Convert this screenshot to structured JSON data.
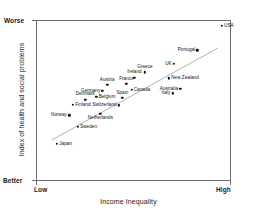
{
  "chart_data": {
    "type": "scatter",
    "title": "",
    "xlabel": "Income Inequality",
    "ylabel": "Index of health and social problems",
    "x_tick_labels": [
      "Low",
      "High"
    ],
    "y_tick_labels": [
      "Worse",
      "Better"
    ],
    "y_axis_top_label": "Worse",
    "y_axis_bottom_label": "Better",
    "x_axis_left_label": "Low",
    "x_axis_right_label": "High",
    "grid": false,
    "legend": null,
    "xlim": [
      0,
      1
    ],
    "ylim": [
      0,
      1
    ],
    "trendline": {
      "type": "linear-fit",
      "x0": 0.082,
      "y0": 0.255,
      "x1": 0.933,
      "y1": 0.826,
      "color": "#a8a8a8"
    },
    "point_color": "#111111",
    "points": [
      {
        "label": "USA",
        "x": 0.953,
        "y": 0.963,
        "label_pos": "right"
      },
      {
        "label": "Portugal",
        "x": 0.828,
        "y": 0.812,
        "label_pos": "left"
      },
      {
        "label": "UK",
        "x": 0.707,
        "y": 0.729,
        "label_pos": "left"
      },
      {
        "label": "Greece",
        "x": 0.559,
        "y": 0.674,
        "label_pos": "above"
      },
      {
        "label": "New Zealand",
        "x": 0.682,
        "y": 0.637,
        "label_pos": "right"
      },
      {
        "label": "Ireland",
        "x": 0.505,
        "y": 0.642,
        "label_pos": "above"
      },
      {
        "label": "France",
        "x": 0.464,
        "y": 0.602,
        "label_pos": "above"
      },
      {
        "label": "Austria",
        "x": 0.365,
        "y": 0.596,
        "label_pos": "above"
      },
      {
        "label": "Australia",
        "x": 0.74,
        "y": 0.574,
        "label_pos": "left"
      },
      {
        "label": "Canada",
        "x": 0.49,
        "y": 0.565,
        "label_pos": "right"
      },
      {
        "label": "Germany",
        "x": 0.341,
        "y": 0.561,
        "label_pos": "left"
      },
      {
        "label": "Italy",
        "x": 0.7,
        "y": 0.545,
        "label_pos": "left"
      },
      {
        "label": "Belgium",
        "x": 0.31,
        "y": 0.524,
        "label_pos": "right"
      },
      {
        "label": "Spain",
        "x": 0.443,
        "y": 0.515,
        "label_pos": "above"
      },
      {
        "label": "Denmark",
        "x": 0.252,
        "y": 0.505,
        "label_pos": "above"
      },
      {
        "label": "Switzerland",
        "x": 0.425,
        "y": 0.469,
        "label_pos": "left"
      },
      {
        "label": "Finland",
        "x": 0.19,
        "y": 0.472,
        "label_pos": "right"
      },
      {
        "label": "Netherlands",
        "x": 0.33,
        "y": 0.416,
        "label_pos": "below"
      },
      {
        "label": "Norway",
        "x": 0.17,
        "y": 0.407,
        "label_pos": "left"
      },
      {
        "label": "Sweden",
        "x": 0.215,
        "y": 0.338,
        "label_pos": "right"
      },
      {
        "label": "Japan",
        "x": 0.108,
        "y": 0.23,
        "label_pos": "right"
      }
    ]
  }
}
